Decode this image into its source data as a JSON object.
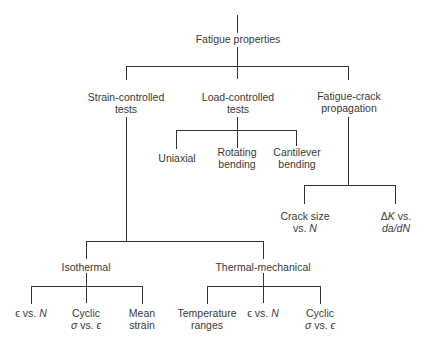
{
  "title": "Fatigue properties",
  "nodes": {
    "root": {
      "label": "Fatigue properties"
    },
    "strain": {
      "line1": "Strain-controlled",
      "line2": "tests"
    },
    "load": {
      "line1": "Load-controlled",
      "line2": "tests"
    },
    "crack": {
      "line1": "Fatigue-crack",
      "line2": "propagation"
    },
    "uniaxial": {
      "label": "Uniaxial"
    },
    "rotating": {
      "line1": "Rotating",
      "line2": "bending"
    },
    "cantilever": {
      "line1": "Cantilever",
      "line2": "bending"
    },
    "crack_size": {
      "line1": "Crack size",
      "line2a": "vs. ",
      "line2b": "N"
    },
    "delta_k": {
      "line1a": "Δ",
      "line1b": "K",
      "line1c": " vs.",
      "line2": "da/dN"
    },
    "isothermal": {
      "label": "Isothermal"
    },
    "thermal": {
      "label": "Thermal-mechanical"
    },
    "iso_eps_n": {
      "a": "ϵ",
      "b": " vs. ",
      "c": "N"
    },
    "iso_cyclic": {
      "line1": "Cyclic",
      "l2a": "σ",
      "l2b": " vs. ",
      "l2c": "ϵ"
    },
    "iso_mean": {
      "line1": "Mean",
      "line2": "strain"
    },
    "tm_temp": {
      "line1": "Temperature",
      "line2": "ranges"
    },
    "tm_eps_n": {
      "a": "ϵ",
      "b": " vs. ",
      "c": "N"
    },
    "tm_cyclic": {
      "line1": "Cyclic",
      "l2a": "σ",
      "l2b": " vs. ",
      "l2c": "ϵ"
    }
  },
  "colors": {
    "line": "#333333",
    "text": "#3a3a3a",
    "background": "#ffffff"
  }
}
